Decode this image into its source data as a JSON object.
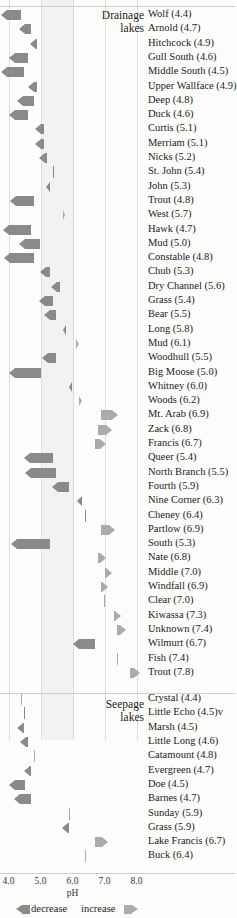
{
  "chart_data": {
    "type": "bar",
    "title": "",
    "xlabel": "pH",
    "ylabel": "",
    "xlim": [
      4.0,
      8.0
    ],
    "grid": true,
    "orientation": "horizontal",
    "axis_ticks": [
      "4.0",
      "5.0",
      "6.0",
      "7.0",
      "8.0"
    ],
    "axis_tick_values": [
      4.0,
      5.0,
      6.0,
      7.0,
      8.0
    ],
    "shaded_band": [
      5.0,
      6.0
    ],
    "legend": {
      "position": "bottom-left",
      "decrease_label": "decrease",
      "increase_label": "increase",
      "decrease_color": "#8a8a8a",
      "increase_color": "#ababab"
    },
    "colors": {
      "decrease": "#8a8a8a",
      "increase": "#ababab",
      "band": "#f2f2f0",
      "gridline": "#dcdcd8",
      "separator": "#cfcfcb"
    },
    "groups": [
      {
        "name": "Drainage lakes",
        "heading_line1": "Drainage",
        "heading_line2": "lakes",
        "series": [
          {
            "label": "Wolf (4.4)",
            "ph": 4.4,
            "delta": -0.62
          },
          {
            "label": "Arnold (4.7)",
            "ph": 4.7,
            "delta": -0.38
          },
          {
            "label": "Hitchcock (4.9)",
            "ph": 4.9,
            "delta": -0.23
          },
          {
            "label": "Gull South (4.6)",
            "ph": 4.6,
            "delta": -0.6
          },
          {
            "label": "Middle South (4.5)",
            "ph": 4.5,
            "delta": -0.72
          },
          {
            "label": "Upper Wallface (4.9)",
            "ph": 4.9,
            "delta": -0.3
          },
          {
            "label": "Deep (4.8)",
            "ph": 4.8,
            "delta": -0.52
          },
          {
            "label": "Duck (4.6)",
            "ph": 4.6,
            "delta": -0.58
          },
          {
            "label": "Curtis (5.1)",
            "ph": 5.1,
            "delta": -0.26
          },
          {
            "label": "Merriam (5.1)",
            "ph": 5.1,
            "delta": -0.26
          },
          {
            "label": "Nicks (5.2)",
            "ph": 5.2,
            "delta": -0.24
          },
          {
            "label": "St. John (5.4)",
            "ph": 5.4,
            "delta": -0.05
          },
          {
            "label": "John (5.3)",
            "ph": 5.3,
            "delta": -0.14
          },
          {
            "label": "Trout (4.8)",
            "ph": 4.8,
            "delta": -0.74
          },
          {
            "label": "West (5.7)",
            "ph": 5.7,
            "delta": 0.08
          },
          {
            "label": "Hawk (4.7)",
            "ph": 4.7,
            "delta": -0.88
          },
          {
            "label": "Mud (5.0)",
            "ph": 5.0,
            "delta": -0.66
          },
          {
            "label": "Constable (4.8)",
            "ph": 4.8,
            "delta": -0.94
          },
          {
            "label": "Chub (5.3)",
            "ph": 5.3,
            "delta": -0.32
          },
          {
            "label": "Dry Channel (5.6)",
            "ph": 5.6,
            "delta": -0.26
          },
          {
            "label": "Grass (5.4)",
            "ph": 5.4,
            "delta": -0.44
          },
          {
            "label": "Bear (5.5)",
            "ph": 5.5,
            "delta": -0.4
          },
          {
            "label": "Long (5.8)",
            "ph": 5.8,
            "delta": -0.11
          },
          {
            "label": "Mud (6.1)",
            "ph": 6.1,
            "delta": 0.12
          },
          {
            "label": "Woodhull (5.5)",
            "ph": 5.5,
            "delta": -0.46
          },
          {
            "label": "Big Moose (5.0)",
            "ph": 5.0,
            "delta": -1.0
          },
          {
            "label": "Whitney (6.0)",
            "ph": 6.0,
            "delta": -0.12
          },
          {
            "label": "Woods (6.2)",
            "ph": 6.2,
            "delta": 0.1
          },
          {
            "label": "Mt. Arab (6.9)",
            "ph": 6.9,
            "delta": 0.52
          },
          {
            "label": "Zack (6.8)",
            "ph": 6.8,
            "delta": 0.44
          },
          {
            "label": "Francis (6.7)",
            "ph": 6.7,
            "delta": 0.36
          },
          {
            "label": "Queer (5.4)",
            "ph": 5.4,
            "delta": -0.92
          },
          {
            "label": "North Branch (5.5)",
            "ph": 5.5,
            "delta": -0.98
          },
          {
            "label": "Fourth (5.9)",
            "ph": 5.9,
            "delta": -0.54
          },
          {
            "label": "Nine Corner (6.3)",
            "ph": 6.3,
            "delta": -0.16
          },
          {
            "label": "Cheney (6.4)",
            "ph": 6.4,
            "delta": -0.04
          },
          {
            "label": "Partlow (6.9)",
            "ph": 6.9,
            "delta": 0.42
          },
          {
            "label": "South (5.3)",
            "ph": 5.3,
            "delta": -1.22
          },
          {
            "label": "Nate (6.8)",
            "ph": 6.8,
            "delta": 0.26
          },
          {
            "label": "Middle (7.0)",
            "ph": 7.0,
            "delta": 0.22
          },
          {
            "label": "Windfall (6.9)",
            "ph": 6.9,
            "delta": 0.2
          },
          {
            "label": "Clear (7.0)",
            "ph": 7.0,
            "delta": 0.02
          },
          {
            "label": "Kiwassa (7.3)",
            "ph": 7.3,
            "delta": 0.22
          },
          {
            "label": "Unknown (7.4)",
            "ph": 7.4,
            "delta": 0.26
          },
          {
            "label": "Wilmurt (6.7)",
            "ph": 6.7,
            "delta": -0.68
          },
          {
            "label": "Fish (7.4)",
            "ph": 7.4,
            "delta": 0.03
          },
          {
            "label": "Trout (7.8)",
            "ph": 7.8,
            "delta": 0.3
          }
        ]
      },
      {
        "name": "Seepage lakes",
        "heading_line1": "Seepage",
        "heading_line2": "lakes",
        "series": [
          {
            "label": "Crystal (4.4)",
            "ph": 4.4,
            "delta": 0.02
          },
          {
            "label": "Little Echo (4.5)v",
            "ph": 4.5,
            "delta": -0.05
          },
          {
            "label": "Marsh (4.5)",
            "ph": 4.5,
            "delta": -0.22
          },
          {
            "label": "Little Long (4.6)",
            "ph": 4.6,
            "delta": -0.24
          },
          {
            "label": "Catamount (4.8)",
            "ph": 4.8,
            "delta": 0.02
          },
          {
            "label": "Evergreen (4.7)",
            "ph": 4.7,
            "delta": -0.22
          },
          {
            "label": "Doe (4.5)",
            "ph": 4.5,
            "delta": -0.5
          },
          {
            "label": "Barnes (4.7)",
            "ph": 4.7,
            "delta": -0.52
          },
          {
            "label": "Sunday (5.9)",
            "ph": 5.9,
            "delta": 0.02
          },
          {
            "label": "Grass (5.9)",
            "ph": 5.9,
            "delta": -0.22
          },
          {
            "label": "Lake Francis (6.7)",
            "ph": 6.7,
            "delta": 0.42
          },
          {
            "label": "Buck (6.4)",
            "ph": 6.4,
            "delta": 0.03
          }
        ]
      }
    ]
  }
}
